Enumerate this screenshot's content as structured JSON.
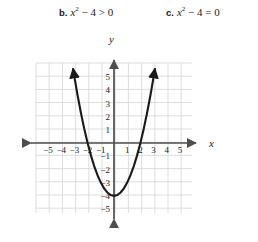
{
  "labels": [
    {
      "id": "b",
      "tag": "b.",
      "lhs": "x",
      "exponent": "2",
      "rest": " − 4 > 0",
      "full": "b. x² − 4 > 0"
    },
    {
      "id": "c",
      "tag": "c.",
      "lhs": "x",
      "exponent": "2",
      "rest": " − 4 = 0",
      "full": "c. x² − 4 = 0"
    }
  ],
  "axes": {
    "x_axis_name": "x",
    "y_axis_name": "y",
    "x_tick_labels": [
      "−5",
      "−4",
      "−3",
      "−2",
      "−1",
      "1",
      "2",
      "3",
      "4",
      "5"
    ],
    "y_tick_labels": [
      "5",
      "4",
      "3",
      "2",
      "1",
      "−1",
      "−2",
      "−3",
      "−4",
      "−5"
    ]
  },
  "colors": {
    "grid": "#d9d9dd",
    "axis": "#4d4d4d",
    "curve": "#1a1a1a",
    "text": "#1a1a1a",
    "background": "#ffffff"
  },
  "chart_data": {
    "type": "line",
    "title": "",
    "xlabel": "x",
    "ylabel": "y",
    "xlim": [
      -6,
      6
    ],
    "ylim": [
      -6,
      6
    ],
    "grid": true,
    "legend": "none",
    "equation": "y = x^2 - 4",
    "vertex": [
      0,
      -4
    ],
    "roots": [
      -2,
      2
    ],
    "series": [
      {
        "name": "y = x^2 - 4",
        "x": [
          -3.1,
          -3.0,
          -2.75,
          -2.5,
          -2.25,
          -2.0,
          -1.75,
          -1.5,
          -1.25,
          -1.0,
          -0.75,
          -0.5,
          -0.25,
          0,
          0.25,
          0.5,
          0.75,
          1.0,
          1.25,
          1.5,
          1.75,
          2.0,
          2.25,
          2.5,
          2.75,
          3.0,
          3.1
        ],
        "y": [
          5.61,
          5.0,
          3.5625,
          2.25,
          1.0625,
          0,
          -0.9375,
          -1.75,
          -2.4375,
          -3.0,
          -3.4375,
          -3.75,
          -3.9375,
          -4.0,
          -3.9375,
          -3.75,
          -3.4375,
          -3.0,
          -2.4375,
          -1.75,
          -0.9375,
          0,
          1.0625,
          2.25,
          3.5625,
          5.0,
          5.61
        ]
      }
    ],
    "annotations": [
      "b. x² − 4 > 0",
      "c. x² − 4 = 0"
    ]
  }
}
